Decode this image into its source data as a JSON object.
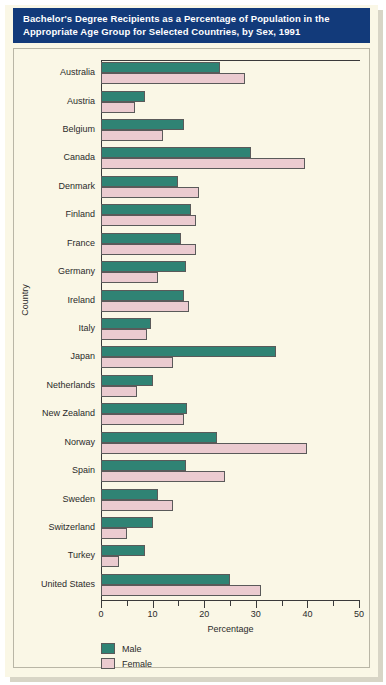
{
  "title": {
    "line1": "Bachelor's Degree Recipients as a Percentage of Population in the",
    "line2": "Appropriate Age Group for Selected Countries, by Sex, 1991"
  },
  "colors": {
    "title_bar": "#123a7a",
    "background": "#faf7e6",
    "male": "#2f8374",
    "female": "#ebcbd0"
  },
  "legend": {
    "male_label": "Male",
    "female_label": "Female"
  },
  "chart_data": {
    "type": "bar",
    "orientation": "horizontal",
    "title": "Bachelor's Degree Recipients as a Percentage of Population in the Appropriate Age Group for Selected Countries, by Sex, 1991",
    "xlabel": "Percentage",
    "ylabel": "Country",
    "xlim": [
      0,
      50
    ],
    "xticks": [
      0,
      5,
      10,
      15,
      20,
      25,
      30,
      35,
      40,
      45,
      50
    ],
    "xtick_labels": [
      "0",
      "",
      "10",
      "",
      "20",
      "",
      "30",
      "",
      "40",
      "",
      "50"
    ],
    "grid": false,
    "legend_position": "bottom-left",
    "categories": [
      "Australia",
      "Austria",
      "Belgium",
      "Canada",
      "Denmark",
      "Finland",
      "France",
      "Germany",
      "Ireland",
      "Italy",
      "Japan",
      "Netherlands",
      "New Zealand",
      "Norway",
      "Spain",
      "Sweden",
      "Switzerland",
      "Turkey",
      "United States"
    ],
    "series": [
      {
        "name": "Male",
        "values": [
          23.0,
          8.5,
          16.0,
          29.0,
          15.0,
          17.5,
          15.5,
          16.5,
          16.0,
          9.7,
          34.0,
          10.0,
          16.7,
          22.5,
          16.5,
          11.0,
          10.0,
          8.5,
          25.0
        ]
      },
      {
        "name": "Female",
        "values": [
          28.0,
          6.5,
          12.0,
          39.5,
          19.0,
          18.5,
          18.5,
          11.0,
          17.0,
          9.0,
          14.0,
          7.0,
          16.0,
          40.0,
          24.0,
          14.0,
          5.0,
          3.5,
          31.0
        ]
      }
    ]
  }
}
